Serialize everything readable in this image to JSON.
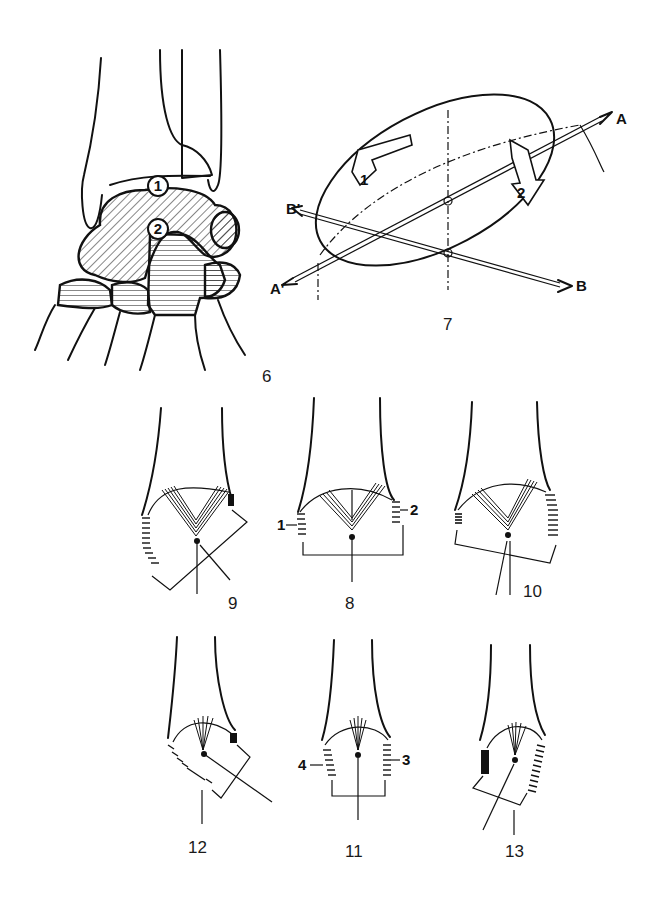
{
  "figures": {
    "fig6": {
      "number": "6",
      "circle_labels": [
        "1",
        "2"
      ],
      "description": "Wrist carpal bones, hatched proximal and distal rows"
    },
    "fig7": {
      "number": "7",
      "axis_labels": {
        "a_top": "A",
        "a_bottom": "A'",
        "b": "B",
        "b_prime": "B'"
      },
      "rotation_arrows": [
        "1",
        "2"
      ],
      "description": "Ellipsoid joint with two axes of rotation"
    },
    "fig8": {
      "number": "8",
      "side_labels": [
        "1",
        "2"
      ]
    },
    "fig9": {
      "number": "9"
    },
    "fig10": {
      "number": "10"
    },
    "fig11": {
      "number": "11",
      "side_labels": [
        "4",
        "3"
      ]
    },
    "fig12": {
      "number": "12"
    },
    "fig13": {
      "number": "13"
    }
  },
  "colors": {
    "ink": "#111111",
    "background": "#ffffff"
  }
}
